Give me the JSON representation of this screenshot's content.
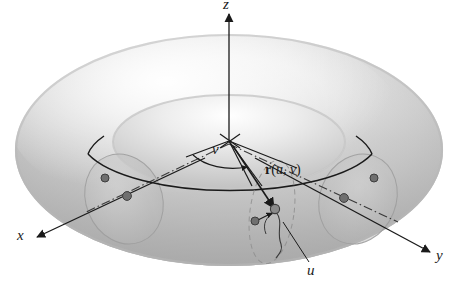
{
  "figure": {
    "background_color": "#ffffff",
    "ink_color": "#1a1a1a"
  },
  "axes": {
    "z": {
      "label": "z",
      "direction": "up"
    },
    "x": {
      "label": "x",
      "direction": "down-left"
    },
    "y": {
      "label": "y",
      "direction": "down-right"
    }
  },
  "annotations": {
    "vector": {
      "name": "r(u, v)",
      "bold_part": "r",
      "open_paren": "(",
      "param_u": "u",
      "comma": ", ",
      "param_v": "v",
      "close_paren": ")"
    },
    "angle_v": {
      "label": "v"
    },
    "param_u": {
      "label": "u"
    }
  },
  "torus": {
    "center_circle_label": "central circle of torus",
    "cross_sections": [
      {
        "name": "left-cross-section-circle"
      },
      {
        "name": "right-cross-section-circle"
      },
      {
        "name": "point-cross-section-circle"
      }
    ],
    "points": [
      {
        "name": "surface-point",
        "note": "endpoint of r(u, v)"
      },
      {
        "name": "small-dot-near-surface-point"
      },
      {
        "name": "left-center-dot"
      },
      {
        "name": "left-circle-dot"
      },
      {
        "name": "right-center-dot"
      },
      {
        "name": "right-circle-dot"
      }
    ],
    "colors": {
      "surface_light": "#fbfbfb",
      "surface_mid": "#d8d8d8",
      "surface_dark": "#b6b6b6",
      "outline": "#1a1a1a",
      "cross_section_fill": "#c9c9c9"
    }
  }
}
